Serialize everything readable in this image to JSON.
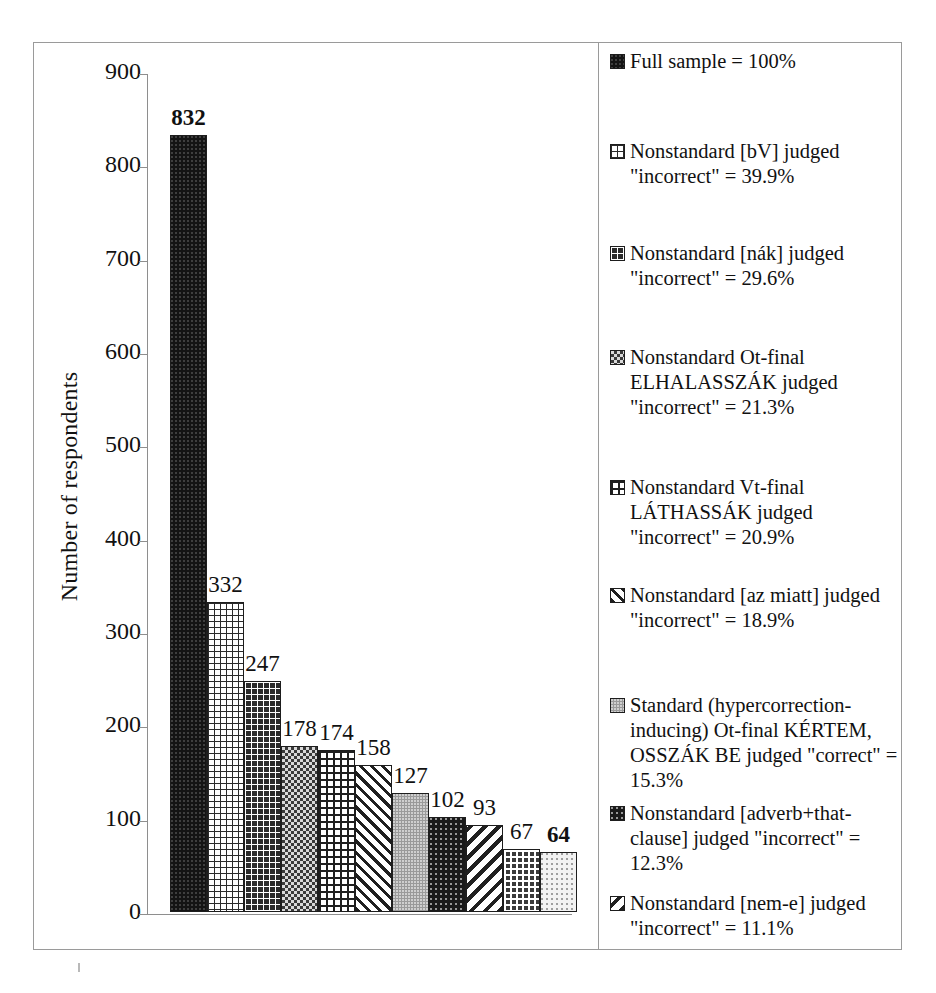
{
  "chart_data": {
    "type": "bar",
    "title": "",
    "xlabel": "",
    "ylabel": "Number of respondents",
    "ylim": [
      0,
      900
    ],
    "ytick_labels": [
      "900",
      "800",
      "700",
      "600",
      "500",
      "400",
      "300",
      "200",
      "100",
      "0"
    ],
    "ytick_values": [
      900,
      800,
      700,
      600,
      500,
      400,
      300,
      200,
      100,
      0
    ],
    "grid": false,
    "legend_position": "right",
    "categories": [
      "Full sample",
      "Nonstandard [bV] judged \"incorrect\"",
      "Nonstandard [nák] judged \"incorrect\"",
      "Nonstandard Ot-final ELHALASSZÁK judged \"incorrect\"",
      "Nonstandard Vt-final LÁTHASSÁK judged \"incorrect\"",
      "Nonstandard [az miatt] judged \"incorrect\"",
      "Standard (hypercorrection-inducing) Ot-final KÉRTEM, OSSZÁK BE judged \"correct\"",
      "Nonstandard [adverb+that-clause] judged \"incorrect\"",
      "Nonstandard [nem-e] judged \"incorrect\"",
      "bar-10",
      "bar-11"
    ],
    "values": [
      832,
      332,
      247,
      178,
      174,
      158,
      127,
      102,
      93,
      67,
      64
    ],
    "value_labels": [
      "832",
      "332",
      "247",
      "178",
      "174",
      "158",
      "127",
      "102",
      "93",
      "67",
      "64"
    ],
    "percentages": [
      "100%",
      "39.9%",
      "29.6%",
      "21.3%",
      "20.9%",
      "18.9%",
      "15.3%",
      "12.3%",
      "11.1%"
    ],
    "bar_patterns": [
      "solid-dot",
      "grid-light",
      "grid-dark",
      "weave-light",
      "check",
      "diag-wide",
      "gray50",
      "dark-speck",
      "diag-back",
      "dot-grid-dark",
      "pale-dot"
    ],
    "bold_labels": [
      0,
      10
    ]
  },
  "axis": {
    "y_title": "Number of respondents",
    "ticks": [
      "900",
      "800",
      "700",
      "600",
      "500",
      "400",
      "300",
      "200",
      "100",
      "0"
    ]
  },
  "bars": [
    {
      "value": 832,
      "label": "832",
      "pattern": "solid-dot",
      "bold": true
    },
    {
      "value": 332,
      "label": "332",
      "pattern": "grid-light",
      "bold": false
    },
    {
      "value": 247,
      "label": "247",
      "pattern": "grid-dark",
      "bold": false
    },
    {
      "value": 178,
      "label": "178",
      "pattern": "weave-light",
      "bold": false
    },
    {
      "value": 174,
      "label": "174",
      "pattern": "check",
      "bold": false
    },
    {
      "value": 158,
      "label": "158",
      "pattern": "diag-wide",
      "bold": false
    },
    {
      "value": 127,
      "label": "127",
      "pattern": "gray50",
      "bold": false
    },
    {
      "value": 102,
      "label": "102",
      "pattern": "dark-speck",
      "bold": false
    },
    {
      "value": 93,
      "label": "93",
      "pattern": "diag-back",
      "bold": false
    },
    {
      "value": 67,
      "label": "67",
      "pattern": "dot-grid-dark",
      "bold": false
    },
    {
      "value": 64,
      "label": "64",
      "pattern": "pale-dot",
      "bold": true
    }
  ],
  "legend": {
    "items": [
      {
        "text": "Full sample = 100%",
        "pattern": "solid-dot"
      },
      {
        "text": "Nonstandard [bV] judged \"incorrect\" = 39.9%",
        "pattern": "grid-light"
      },
      {
        "text": "Nonstandard [nák] judged \"incorrect\" = 29.6%",
        "pattern": "grid-dark"
      },
      {
        "text": "Nonstandard Ot-final ELHALASSZÁK judged \"incorrect\" = 21.3%",
        "pattern": "weave-light"
      },
      {
        "text": "Nonstandard Vt-final LÁTHASSÁK judged \"incorrect\" = 20.9%",
        "pattern": "check"
      },
      {
        "text": "Nonstandard [az miatt] judged \"incorrect\" = 18.9%",
        "pattern": "diag-wide"
      },
      {
        "text": "Standard (hypercorrection-inducing) Ot-final KÉRTEM, OSSZÁK BE judged \"correct\" = 15.3%",
        "pattern": "gray50"
      },
      {
        "text": "Nonstandard [adverb+that-clause] judged \"incorrect\" = 12.3%",
        "pattern": "dark-speck"
      },
      {
        "text": "Nonstandard [nem-e] judged \"incorrect\" = 11.1%",
        "pattern": "diag-back"
      }
    ]
  },
  "colors": {
    "frame": "#9a9a9a",
    "axis": "#8e8e8e",
    "bar_outline": "#1d1d1d",
    "text": "#111111",
    "background": "#ffffff"
  }
}
